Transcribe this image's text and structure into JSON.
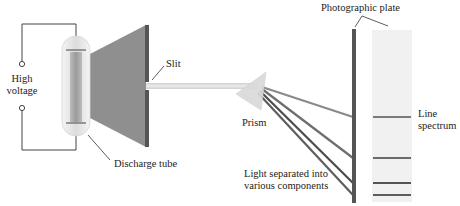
{
  "labels": {
    "high_voltage_line1": "High",
    "high_voltage_line2": "voltage",
    "discharge_tube": "Discharge tube",
    "slit": "Slit",
    "prism": "Prism",
    "light_separated_line1": "Light separated into",
    "light_separated_line2": "various components",
    "photographic_plate": "Photographic plate",
    "line_spectrum_line1": "Line",
    "line_spectrum_line2": "spectrum"
  },
  "colors": {
    "wire": "#444444",
    "tube_glow": "#c8c8c8",
    "light_cone": "#8f8f8f",
    "slit_bar": "#555555",
    "beam": "#d8d8d8",
    "prism": "#dcdcdc",
    "dispersed_rays": [
      "#8a8a8a",
      "#6e6e6e",
      "#4c4c4c",
      "#5e5e5e"
    ],
    "plate_bar": "#555555",
    "spectrum_strip": "#f1f1f1",
    "spectrum_lines": "#6a6a6a"
  },
  "spectrum_lines_y": [
    117,
    158,
    183,
    195
  ]
}
